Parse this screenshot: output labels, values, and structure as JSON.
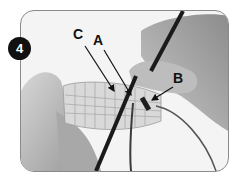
{
  "figure": {
    "step_number": "4",
    "labels": [
      {
        "id": "C",
        "text": "C"
      },
      {
        "id": "A",
        "text": "A"
      },
      {
        "id": "B",
        "text": "B"
      }
    ],
    "colors": {
      "badge_bg": "#111111",
      "badge_text": "#ffffff",
      "label_text": "#111111",
      "frame_border": "#8a8a8a",
      "photo_bg": "#f4f4f4"
    }
  }
}
